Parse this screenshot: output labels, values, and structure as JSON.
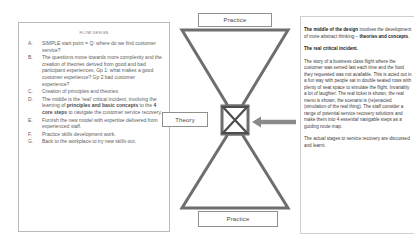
{
  "flow_design": {
    "title": "FLOW DESIGN",
    "items": [
      {
        "letter": "A.",
        "text": "SIMPLE start point = Q: where do we find customer service?"
      },
      {
        "letter": "B.",
        "text": "The questions move towards more complexity and the creation of theories derived from good and bad participant experiences. Gp 1: what makes a good customer experience? Gp 2 bad customer experience?"
      },
      {
        "letter": "C.",
        "text": "Creation of principles and theories"
      },
      {
        "letter": "D.",
        "html": "The middle is the 'real' critical incident, involving the learning of <b>principles and basic concepts</b> to the <b>4 core steps</b> to navigate the customer service recovery."
      },
      {
        "letter": "E.",
        "text": "Furnish the new model with expertise delivered from experienced staff."
      },
      {
        "letter": "F.",
        "text": "Practice skills development work."
      },
      {
        "letter": "G.",
        "text": "Back to the workplace to try new skills out."
      }
    ]
  },
  "diagram": {
    "practice_top_label": "Practice",
    "practice_bottom_label": "Practice",
    "theory_label": "Theory",
    "shape": "hourglass",
    "arrow_direction": "left",
    "outline_color": "#6e6e6e",
    "box_border_color": "#8f8f8f"
  },
  "notes": {
    "paragraphs": [
      {
        "id": "p1",
        "html": "<b>The middle of the design</b> involves the development of more abstract thinking &ndash; <b>theories and concepts</b>."
      },
      {
        "id": "p2",
        "html": "<b>The real critical incident.</b>"
      },
      {
        "id": "p3",
        "html": "The story of a business class flight where the customer was served last each time and the food they requested was not available. This is acted out in a fun way with people sat in double seated rows with plenty of seat space to simulate the flight. Invariably a lot of laughter. The real ticket is shown, the real menu is shown, the scenario is (re)enacted (simulation of the real thing). The staff consider a range of potential service recovery solutions and make them into 4 essential navigable steps as a guiding route map."
      },
      {
        "id": "p4",
        "html": "The actual stages to service recovery are discussed and learnt."
      }
    ]
  }
}
